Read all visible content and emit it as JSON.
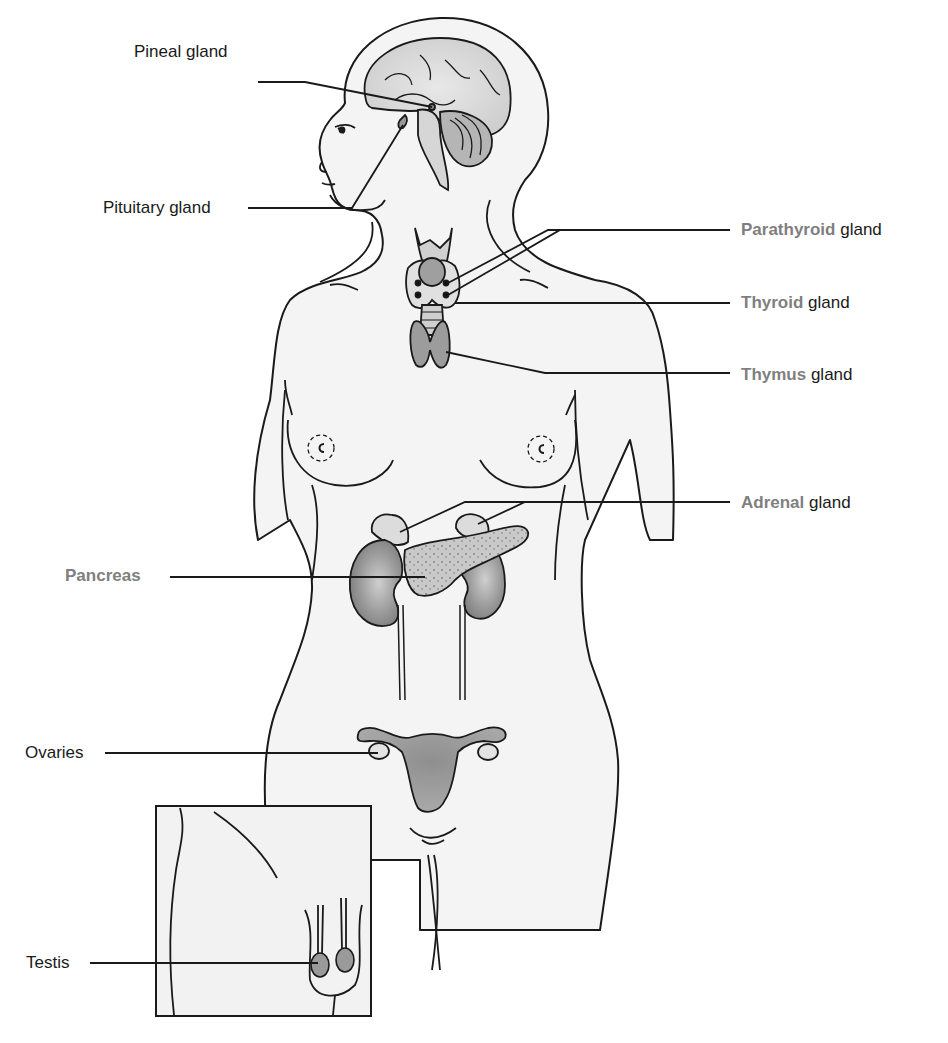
{
  "figure": {
    "colors": {
      "outline": "#1a1a1a",
      "skin_fill": "#f4f4f4",
      "organ_fill": "#a8a8a8",
      "organ_dark": "#8c8c8c",
      "highlight_label": "#7f7f7f",
      "plain_label": "#1a1a1a"
    }
  },
  "labels": {
    "pineal": {
      "text": "Pineal gland"
    },
    "pituitary": {
      "text": "Pituitary gland"
    },
    "parathyroid": {
      "highlight": "Parathyroid",
      "rest": " gland"
    },
    "thyroid": {
      "highlight": "Thyroid",
      "rest": " gland"
    },
    "thymus": {
      "highlight": "Thymus",
      "rest": " gland"
    },
    "adrenal": {
      "highlight": "Adrenal",
      "rest": " gland"
    },
    "pancreas": {
      "highlight": "Pancreas"
    },
    "ovaries": {
      "text": "Ovaries"
    },
    "testis": {
      "text": "Testis"
    }
  },
  "inset": {
    "subject": "Male pelvic region (testes)"
  }
}
